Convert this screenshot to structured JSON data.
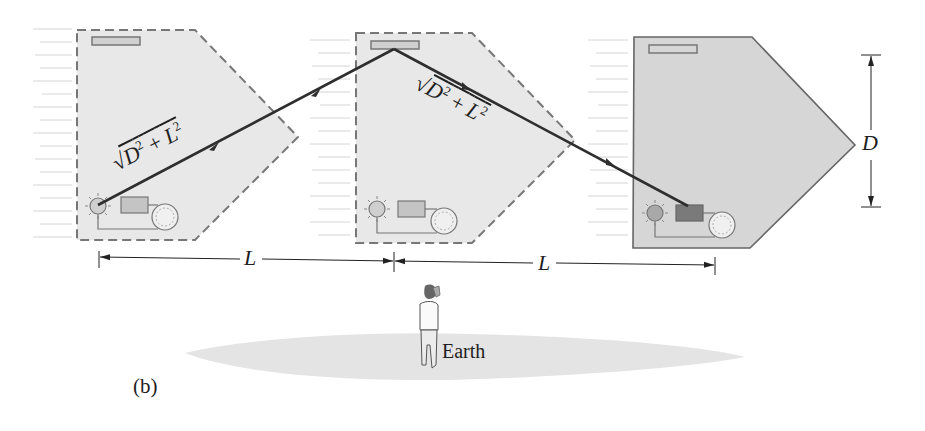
{
  "figure": {
    "panel_label": "(b)",
    "earth_label": "Earth",
    "path_length_label": {
      "radical": "√",
      "expression": "D² + L²",
      "D": "D",
      "plus": "+",
      "L": "L",
      "exp": "2"
    },
    "horizontal_distance_label": "L",
    "vertical_distance_label": "D",
    "colors": {
      "satellite_fill_ghost": "#e8e8e8",
      "satellite_fill_solid": "#d6d6d6",
      "outline": "#777777",
      "light_path": "#2e2e2e",
      "ground": "#e4e4e4",
      "detector_lit": "#7a7a7a",
      "detector_unlit": "#c4c4c4"
    },
    "satellites": [
      {
        "id": "position-1",
        "style": "dashed",
        "x": 77
      },
      {
        "id": "position-2",
        "style": "dashed",
        "x": 356
      },
      {
        "id": "position-3",
        "style": "solid",
        "x": 633
      }
    ]
  }
}
